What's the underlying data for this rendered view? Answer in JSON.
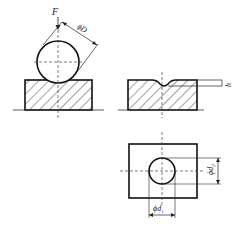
{
  "figure": {
    "labels": {
      "force": "F",
      "ball_diameter": "ϕD",
      "indent_depth": "h",
      "indent_d1": "ϕd",
      "indent_d1_sub": "1",
      "indent_d2": "ϕd",
      "indent_d2_sub": "2"
    },
    "views": [
      {
        "name": "ball-on-specimen",
        "description": "Ball of diameter D pressed by force F onto hatched specimen"
      },
      {
        "name": "indented-specimen-section",
        "description": "Specimen section showing indentation of depth h"
      },
      {
        "name": "indent-top-view",
        "description": "Top view of specimen with circular indent diameters d1 and d2"
      }
    ],
    "colors": {
      "line": "#222222",
      "background": "#ffffff"
    }
  }
}
